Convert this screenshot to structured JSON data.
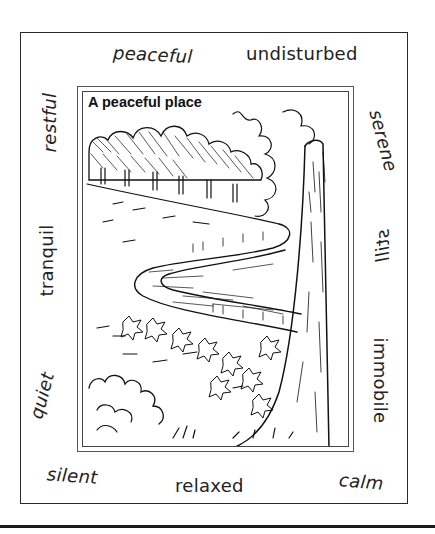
{
  "worksheet": {
    "picture_title": "A peaceful place",
    "words": {
      "top_left": "peaceful",
      "top_right": "undisturbed",
      "left_top": "restful",
      "left_middle": "tranquil",
      "left_bottom": "quiet",
      "right_top": "serene",
      "right_middle": "still",
      "right_bottom": "immobile",
      "bottom_left": "silent",
      "bottom_middle": "relaxed",
      "bottom_right": "calm"
    },
    "illustration": "pen-and-ink drawing of a winding river through a meadow, a row of trees on the far bank, a large tree trunk on the right, leafy plants and bushes in the foreground"
  }
}
